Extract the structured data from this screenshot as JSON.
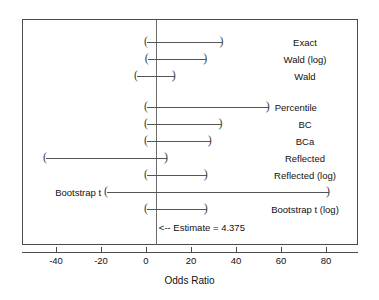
{
  "chart_data": {
    "type": "forest",
    "title": "",
    "xlabel": "Odds Ratio",
    "ylabel": "",
    "xlim": [
      -55.5,
      94.0
    ],
    "xticks": [
      -40,
      -20,
      0,
      20,
      40,
      60,
      80
    ],
    "xticklabels": [
      "-40",
      "-20",
      "0",
      "20",
      "40",
      "60",
      "80"
    ],
    "grid": false,
    "legend": null,
    "point_estimate": 4.375,
    "estimate_annotation": "<-- Estimate = 4.375",
    "interval_cap_glyph_left": "(",
    "interval_cap_glyph_right": ")",
    "rows": [
      {
        "label": "Exact",
        "lower": 0.4,
        "upper": 34.0,
        "label_align": "center"
      },
      {
        "label": "Wald (log)",
        "lower": 0.8,
        "upper": 26.8,
        "label_align": "center"
      },
      {
        "label": "Wald",
        "lower": -4.0,
        "upper": 12.8,
        "label_align": "center"
      },
      {
        "label": "Percentile",
        "lower": 0.4,
        "upper": 54.5,
        "label_align": "right"
      },
      {
        "label": "BC",
        "lower": 0.4,
        "upper": 33.5,
        "label_align": "center"
      },
      {
        "label": "BCa",
        "lower": 0.4,
        "upper": 28.8,
        "label_align": "center"
      },
      {
        "label": "Reflected",
        "lower": -44.5,
        "upper": 9.3,
        "label_align": "center"
      },
      {
        "label": "Reflected (log)",
        "lower": 0.4,
        "upper": 27.0,
        "label_align": "center"
      },
      {
        "label": "Bootstrap t",
        "lower": -17.3,
        "upper": 81.3,
        "label_align": "left"
      },
      {
        "label": "Bootstrap t (log)",
        "lower": 0.4,
        "upper": 27.0,
        "label_align": "center"
      }
    ]
  }
}
